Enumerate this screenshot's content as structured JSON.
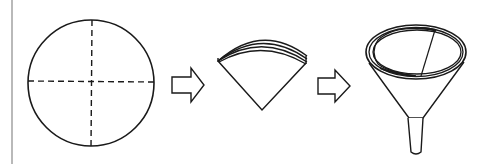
{
  "diagram": {
    "description": "Folding a circular filter paper into a cone and placing it into a funnel",
    "steps": [
      {
        "id": "step-1",
        "label": "Circular filter paper with fold lines"
      },
      {
        "id": "step-2",
        "label": "Paper folded into quarter (fan shape)"
      },
      {
        "id": "step-3",
        "label": "Opened cone placed in funnel"
      }
    ],
    "arrows": [
      {
        "from": "step-1",
        "to": "step-2"
      },
      {
        "from": "step-2",
        "to": "step-3"
      }
    ],
    "colors": {
      "stroke": "#1a1a1a",
      "background": "#ffffff",
      "border": "#8a8a8a"
    }
  }
}
